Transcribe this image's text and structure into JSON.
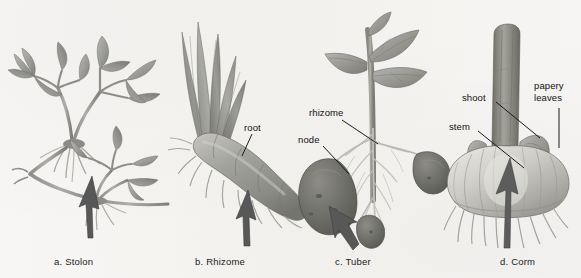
{
  "figure": {
    "background_color": "#f6f5f2",
    "ink_color": "#1a1a1a"
  },
  "captions": [
    {
      "id": "stolon",
      "text": "a. Stolon"
    },
    {
      "id": "rhizome",
      "text": "b. Rhizome"
    },
    {
      "id": "tuber",
      "text": "c. Tuber"
    },
    {
      "id": "corm",
      "text": "d. Corm"
    }
  ],
  "labels": {
    "root": "root",
    "rhizome": "rhizome",
    "node": "node",
    "shoot": "shoot",
    "stem": "stem",
    "papery_line1": "papery",
    "papery_line2": "leaves"
  },
  "panels": [
    {
      "id": "panel-a",
      "caption": "a. Stolon",
      "subject": "clover plant with horizontal runner",
      "has_arrow": true,
      "arrow_points_to": "stolon runner"
    },
    {
      "id": "panel-b",
      "caption": "b. Rhizome",
      "subject": "iris rhizome with sword leaves and fibrous roots",
      "has_arrow": true,
      "arrow_points_to": "rhizome body",
      "callouts": [
        "root"
      ]
    },
    {
      "id": "panel-c",
      "caption": "c. Tuber",
      "subject": "potato plant with tubers on stolons",
      "has_arrow": true,
      "arrow_points_to": "tuber",
      "callouts": [
        "rhizome",
        "node"
      ]
    },
    {
      "id": "panel-d",
      "caption": "d. Corm",
      "subject": "gladiolus corm with shoot and papery leaves",
      "has_arrow": true,
      "arrow_points_to": "corm body",
      "callouts": [
        "shoot",
        "stem",
        "papery leaves"
      ]
    }
  ],
  "palette": {
    "paper": "#f6f5f2",
    "leaf_light": "#b9b9b5",
    "leaf_mid": "#9b9b97",
    "leaf_dark": "#7c7c78",
    "rhizome_body": "#9a9a96",
    "tuber_dark": "#6e6e6b",
    "corm_light": "#d2d1cc",
    "root_pale": "#c9c8c3",
    "ink": "#1a1a1a"
  }
}
